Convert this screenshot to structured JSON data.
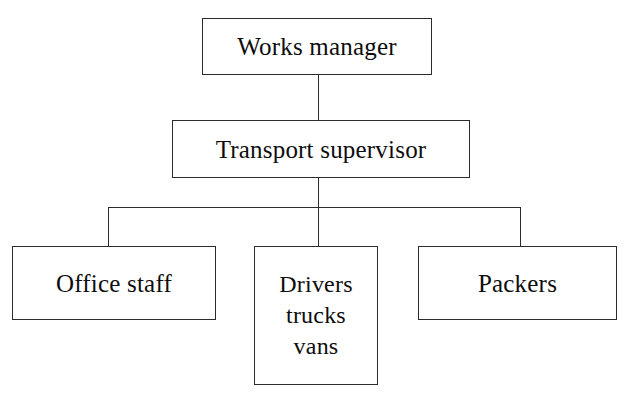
{
  "diagram": {
    "type": "organisational-hierarchy-chart",
    "background_color": "#ffffff",
    "line_color": "#2b2b2b",
    "text_color": "#0d0d0d",
    "nodes": [
      {
        "id": "works-manager",
        "label": "Works manager",
        "level": 1
      },
      {
        "id": "transport-supervisor",
        "label": "Transport supervisor",
        "level": 2
      },
      {
        "id": "office-staff",
        "label": "Office staff",
        "level": 3
      },
      {
        "id": "drivers-trucks-vans",
        "label": "Drivers\ntrucks\nvans",
        "level": 3
      },
      {
        "id": "packers",
        "label": "Packers",
        "level": 3
      }
    ],
    "edges": [
      {
        "from": "works-manager",
        "to": "transport-supervisor"
      },
      {
        "from": "transport-supervisor",
        "to": "office-staff"
      },
      {
        "from": "transport-supervisor",
        "to": "drivers-trucks-vans"
      },
      {
        "from": "transport-supervisor",
        "to": "packers"
      }
    ]
  }
}
